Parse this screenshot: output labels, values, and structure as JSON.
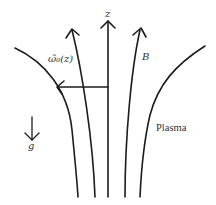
{
  "diagram": {
    "labels": {
      "z_axis": "z",
      "omega": "ω̃₀(z)",
      "field": "B",
      "plasma": "Plasma",
      "gravity": "g"
    },
    "elements": {
      "field_lines": [
        "outer-left",
        "inner-left",
        "center-z-axis",
        "inner-right",
        "outer-right"
      ],
      "arrows": [
        "z-axis-arrow",
        "inner-left-arrow",
        "inner-right-arrow",
        "omega-horizontal-arrow",
        "gravity-arrow"
      ]
    },
    "colors": {
      "line": "#1c1c1c",
      "text": "#333333",
      "background": "#ffffff"
    }
  }
}
